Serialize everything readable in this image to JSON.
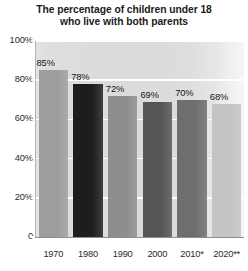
{
  "chart_data": {
    "type": "bar",
    "title": "The percentage of children under 18 who live with both parents",
    "title_lines": [
      "The percentage of children under 18",
      "who live with both parents"
    ],
    "categories": [
      "1970",
      "1980",
      "1990",
      "2000",
      "2010*",
      "2020**"
    ],
    "values": [
      85,
      78,
      72,
      69,
      70,
      68
    ],
    "value_labels": [
      "85%",
      "78%",
      "72%",
      "69%",
      "70%",
      "68%"
    ],
    "xlabel": "",
    "ylabel": "",
    "ylim": [
      0,
      100
    ],
    "yticks": [
      0,
      20,
      40,
      60,
      80,
      100
    ],
    "ytick_labels": [
      "0",
      "20%",
      "40%",
      "60%",
      "80%",
      "100%"
    ],
    "grid": true,
    "legend": false,
    "bar_colors": [
      "#9d9d9d",
      "#1d1d1d",
      "#8d8d8d",
      "#555555",
      "#6e6e6e",
      "#c4c4c4"
    ],
    "plot_background": "#dcdcdc",
    "gridline_color": "#ffffff",
    "text_color": "#1b1b1b"
  }
}
